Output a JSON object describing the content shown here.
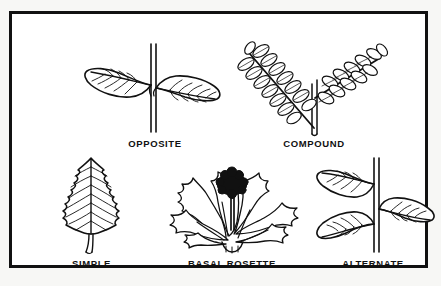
{
  "figure": {
    "background_color": "#f7f7f5",
    "page_color": "#ffffff",
    "ink_color": "#111111",
    "border_color": "#111111"
  },
  "panels": [
    {
      "id": "opposite",
      "label": "OPPOSITE",
      "icon": "opposite-leaf-arrangement-icon",
      "description": "Two leaves attached at the same node on opposite sides of a stem",
      "leaf_count": 2
    },
    {
      "id": "compound",
      "label": "COMPOUND",
      "icon": "compound-leaf-icon",
      "description": "Two pinnately compound leaves with paired leaflets on a V-shaped stem",
      "leaf_count": 2,
      "leaflet_pairs": 7
    },
    {
      "id": "simple",
      "label": "SIMPLE",
      "icon": "simple-leaf-icon",
      "description": "Single ovate leaf blade with toothed margin and short petiole",
      "leaf_count": 1
    },
    {
      "id": "basal-rosette",
      "label": "BASAL ROSETTE",
      "icon": "basal-rosette-icon",
      "description": "Dandelion with deeply lobed leaves radiating from the base and a flower head",
      "leaf_count": 7
    },
    {
      "id": "alternate",
      "label": "ALTERNATE",
      "icon": "alternate-leaf-arrangement-icon",
      "description": "Leaves attached singly at staggered nodes along a stem",
      "leaf_count": 3
    }
  ]
}
